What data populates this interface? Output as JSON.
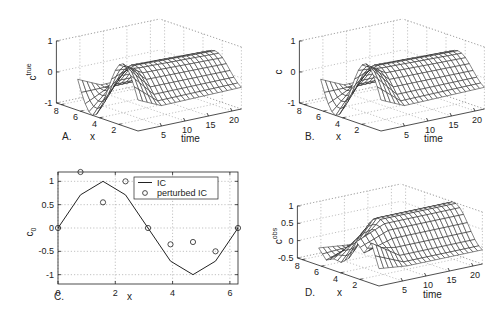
{
  "chart_data": [
    {
      "panel": "A",
      "type": "surface",
      "zlabel": "c",
      "zlabel_sup": "true",
      "xlabel": "x",
      "ylabel": "time",
      "panel_label": "A.",
      "x_ticks": [
        "2",
        "4",
        "6",
        "8"
      ],
      "t_ticks": [
        "5",
        "10",
        "15",
        "20"
      ],
      "z_ticks": [
        "-1",
        "0",
        "1"
      ],
      "zlim": [
        -1,
        1
      ],
      "x_range": [
        0,
        6.2832
      ],
      "t_range": [
        0,
        22
      ],
      "description": "Initial sine profile c(x,0)=sin(x) that shifts/relaxes to a ridge over time",
      "x_nodes": [
        0,
        0.785,
        1.571,
        2.356,
        3.142,
        3.927,
        4.712,
        5.498,
        6.283
      ],
      "initial_profile": [
        0,
        0.71,
        1,
        0.71,
        0,
        -0.71,
        -1,
        -0.71,
        0
      ]
    },
    {
      "panel": "B",
      "type": "surface",
      "zlabel": "c",
      "zlabel_sup": "",
      "xlabel": "x",
      "ylabel": "time",
      "panel_label": "B.",
      "x_ticks": [
        "2",
        "4",
        "6",
        "8"
      ],
      "t_ticks": [
        "5",
        "10",
        "15",
        "20"
      ],
      "z_ticks": [
        "-1",
        "0",
        "1"
      ],
      "zlim": [
        -1,
        1
      ],
      "x_range": [
        0,
        6.2832
      ],
      "t_range": [
        0,
        22
      ]
    },
    {
      "panel": "C",
      "type": "line+scatter",
      "xlabel": "x",
      "ylabel": "c",
      "ylabel_sub": "0",
      "panel_label": "C.",
      "xlim": [
        0,
        6.2832
      ],
      "ylim": [
        -1.2,
        1.2
      ],
      "x_ticks": [
        "0",
        "2",
        "4",
        "6"
      ],
      "y_ticks": [
        "-1",
        "-0.5",
        "0",
        "0.5",
        "1"
      ],
      "grid": true,
      "legend": {
        "position": "upper right",
        "entries": [
          "IC",
          "perturbed IC"
        ]
      },
      "series": [
        {
          "name": "IC",
          "style": "line",
          "x": [
            0,
            0.785,
            1.571,
            2.356,
            3.142,
            3.927,
            4.712,
            5.498,
            6.283
          ],
          "y": [
            0,
            0.71,
            1.0,
            0.71,
            0,
            -0.71,
            -1.0,
            -0.71,
            0
          ]
        },
        {
          "name": "perturbed IC",
          "style": "circle",
          "x": [
            0,
            0.785,
            1.571,
            2.356,
            3.142,
            3.927,
            4.712,
            5.498,
            6.283
          ],
          "y": [
            0,
            1.2,
            0.55,
            1.0,
            0,
            -0.35,
            -0.3,
            -0.5,
            0
          ]
        }
      ]
    },
    {
      "panel": "D",
      "type": "surface",
      "zlabel": "c",
      "zlabel_sup": "obs",
      "xlabel": "x",
      "ylabel": "time",
      "panel_label": "D.",
      "x_ticks": [
        "2",
        "4",
        "6",
        "8"
      ],
      "t_ticks": [
        "5",
        "10",
        "15",
        "20"
      ],
      "z_ticks": [
        "-0.5",
        "0",
        "0.5",
        "1"
      ],
      "zlim": [
        -0.5,
        1
      ],
      "x_range": [
        0,
        6.2832
      ],
      "t_range": [
        0,
        22
      ],
      "initial_profile": [
        0,
        1.2,
        0.55,
        1.0,
        0,
        -0.35,
        -0.3,
        -0.5,
        0
      ]
    }
  ]
}
